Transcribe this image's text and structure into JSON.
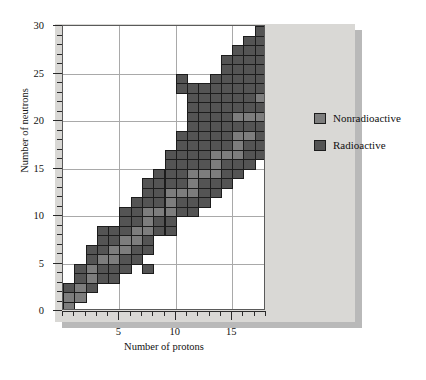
{
  "chart_data": {
    "type": "heatmap",
    "title": "",
    "xlabel": "Number of protons",
    "ylabel": "Number of neutrons",
    "xlim": [
      0,
      18
    ],
    "ylim": [
      0,
      30
    ],
    "xticks": [
      5,
      10,
      15
    ],
    "yticks": [
      0,
      5,
      10,
      15,
      20,
      25,
      30
    ],
    "grid": true,
    "legend_position": "right",
    "series": [
      {
        "name": "Nonradioactive",
        "color": "#7d7d7d"
      },
      {
        "name": "Radioactive",
        "color": "#545454"
      }
    ],
    "x_unit": "protons",
    "y_unit": "neutrons",
    "cells": [
      {
        "x": 1,
        "y": 0,
        "t": "non"
      },
      {
        "x": 1,
        "y": 1,
        "t": "non"
      },
      {
        "x": 1,
        "y": 2,
        "t": "rad"
      },
      {
        "x": 2,
        "y": 1,
        "t": "non"
      },
      {
        "x": 2,
        "y": 2,
        "t": "non"
      },
      {
        "x": 2,
        "y": 3,
        "t": "rad"
      },
      {
        "x": 2,
        "y": 4,
        "t": "rad"
      },
      {
        "x": 3,
        "y": 2,
        "t": "rad"
      },
      {
        "x": 3,
        "y": 3,
        "t": "non"
      },
      {
        "x": 3,
        "y": 4,
        "t": "non"
      },
      {
        "x": 3,
        "y": 5,
        "t": "rad"
      },
      {
        "x": 3,
        "y": 6,
        "t": "rad"
      },
      {
        "x": 4,
        "y": 3,
        "t": "rad"
      },
      {
        "x": 4,
        "y": 4,
        "t": "rad"
      },
      {
        "x": 4,
        "y": 5,
        "t": "non"
      },
      {
        "x": 4,
        "y": 6,
        "t": "rad"
      },
      {
        "x": 4,
        "y": 7,
        "t": "rad"
      },
      {
        "x": 4,
        "y": 8,
        "t": "rad"
      },
      {
        "x": 5,
        "y": 3,
        "t": "rad"
      },
      {
        "x": 5,
        "y": 4,
        "t": "rad"
      },
      {
        "x": 5,
        "y": 5,
        "t": "non"
      },
      {
        "x": 5,
        "y": 6,
        "t": "non"
      },
      {
        "x": 5,
        "y": 7,
        "t": "rad"
      },
      {
        "x": 5,
        "y": 8,
        "t": "rad"
      },
      {
        "x": 6,
        "y": 4,
        "t": "rad"
      },
      {
        "x": 6,
        "y": 5,
        "t": "rad"
      },
      {
        "x": 6,
        "y": 6,
        "t": "non"
      },
      {
        "x": 6,
        "y": 7,
        "t": "non"
      },
      {
        "x": 6,
        "y": 8,
        "t": "rad"
      },
      {
        "x": 6,
        "y": 9,
        "t": "rad"
      },
      {
        "x": 6,
        "y": 10,
        "t": "rad"
      },
      {
        "x": 7,
        "y": 5,
        "t": "rad"
      },
      {
        "x": 7,
        "y": 6,
        "t": "rad"
      },
      {
        "x": 7,
        "y": 7,
        "t": "non"
      },
      {
        "x": 7,
        "y": 8,
        "t": "non"
      },
      {
        "x": 7,
        "y": 9,
        "t": "rad"
      },
      {
        "x": 7,
        "y": 10,
        "t": "rad"
      },
      {
        "x": 7,
        "y": 11,
        "t": "rad"
      },
      {
        "x": 8,
        "y": 6,
        "t": "rad"
      },
      {
        "x": 8,
        "y": 7,
        "t": "rad"
      },
      {
        "x": 8,
        "y": 8,
        "t": "non"
      },
      {
        "x": 8,
        "y": 9,
        "t": "non"
      },
      {
        "x": 8,
        "y": 10,
        "t": "non"
      },
      {
        "x": 8,
        "y": 11,
        "t": "rad"
      },
      {
        "x": 8,
        "y": 12,
        "t": "rad"
      },
      {
        "x": 8,
        "y": 13,
        "t": "rad"
      },
      {
        "x": 8,
        "y": 4,
        "t": "rad"
      },
      {
        "x": 9,
        "y": 8,
        "t": "rad"
      },
      {
        "x": 9,
        "y": 9,
        "t": "rad"
      },
      {
        "x": 9,
        "y": 10,
        "t": "non"
      },
      {
        "x": 9,
        "y": 11,
        "t": "rad"
      },
      {
        "x": 9,
        "y": 12,
        "t": "rad"
      },
      {
        "x": 9,
        "y": 13,
        "t": "rad"
      },
      {
        "x": 9,
        "y": 14,
        "t": "rad"
      },
      {
        "x": 10,
        "y": 8,
        "t": "rad"
      },
      {
        "x": 10,
        "y": 9,
        "t": "rad"
      },
      {
        "x": 10,
        "y": 10,
        "t": "non"
      },
      {
        "x": 10,
        "y": 11,
        "t": "non"
      },
      {
        "x": 10,
        "y": 12,
        "t": "non"
      },
      {
        "x": 10,
        "y": 13,
        "t": "rad"
      },
      {
        "x": 10,
        "y": 14,
        "t": "rad"
      },
      {
        "x": 10,
        "y": 15,
        "t": "rad"
      },
      {
        "x": 10,
        "y": 16,
        "t": "rad"
      },
      {
        "x": 11,
        "y": 10,
        "t": "rad"
      },
      {
        "x": 11,
        "y": 11,
        "t": "rad"
      },
      {
        "x": 11,
        "y": 12,
        "t": "non"
      },
      {
        "x": 11,
        "y": 13,
        "t": "rad"
      },
      {
        "x": 11,
        "y": 14,
        "t": "rad"
      },
      {
        "x": 11,
        "y": 15,
        "t": "rad"
      },
      {
        "x": 11,
        "y": 16,
        "t": "rad"
      },
      {
        "x": 11,
        "y": 17,
        "t": "rad"
      },
      {
        "x": 11,
        "y": 18,
        "t": "rad"
      },
      {
        "x": 11,
        "y": 23,
        "t": "rad"
      },
      {
        "x": 11,
        "y": 24,
        "t": "rad"
      },
      {
        "x": 12,
        "y": 10,
        "t": "rad"
      },
      {
        "x": 12,
        "y": 11,
        "t": "rad"
      },
      {
        "x": 12,
        "y": 12,
        "t": "non"
      },
      {
        "x": 12,
        "y": 13,
        "t": "non"
      },
      {
        "x": 12,
        "y": 14,
        "t": "non"
      },
      {
        "x": 12,
        "y": 15,
        "t": "rad"
      },
      {
        "x": 12,
        "y": 16,
        "t": "rad"
      },
      {
        "x": 12,
        "y": 17,
        "t": "rad"
      },
      {
        "x": 12,
        "y": 18,
        "t": "rad"
      },
      {
        "x": 12,
        "y": 19,
        "t": "rad"
      },
      {
        "x": 12,
        "y": 20,
        "t": "rad"
      },
      {
        "x": 12,
        "y": 21,
        "t": "rad"
      },
      {
        "x": 12,
        "y": 22,
        "t": "rad"
      },
      {
        "x": 12,
        "y": 23,
        "t": "rad"
      },
      {
        "x": 13,
        "y": 11,
        "t": "rad"
      },
      {
        "x": 13,
        "y": 12,
        "t": "rad"
      },
      {
        "x": 13,
        "y": 13,
        "t": "rad"
      },
      {
        "x": 13,
        "y": 14,
        "t": "non"
      },
      {
        "x": 13,
        "y": 15,
        "t": "rad"
      },
      {
        "x": 13,
        "y": 16,
        "t": "rad"
      },
      {
        "x": 13,
        "y": 17,
        "t": "rad"
      },
      {
        "x": 13,
        "y": 18,
        "t": "rad"
      },
      {
        "x": 13,
        "y": 19,
        "t": "rad"
      },
      {
        "x": 13,
        "y": 20,
        "t": "rad"
      },
      {
        "x": 13,
        "y": 21,
        "t": "rad"
      },
      {
        "x": 13,
        "y": 22,
        "t": "rad"
      },
      {
        "x": 13,
        "y": 23,
        "t": "rad"
      },
      {
        "x": 14,
        "y": 12,
        "t": "rad"
      },
      {
        "x": 14,
        "y": 13,
        "t": "rad"
      },
      {
        "x": 14,
        "y": 14,
        "t": "non"
      },
      {
        "x": 14,
        "y": 15,
        "t": "non"
      },
      {
        "x": 14,
        "y": 16,
        "t": "non"
      },
      {
        "x": 14,
        "y": 17,
        "t": "rad"
      },
      {
        "x": 14,
        "y": 18,
        "t": "rad"
      },
      {
        "x": 14,
        "y": 19,
        "t": "rad"
      },
      {
        "x": 14,
        "y": 20,
        "t": "rad"
      },
      {
        "x": 14,
        "y": 21,
        "t": "rad"
      },
      {
        "x": 14,
        "y": 22,
        "t": "rad"
      },
      {
        "x": 14,
        "y": 23,
        "t": "rad"
      },
      {
        "x": 14,
        "y": 24,
        "t": "rad"
      },
      {
        "x": 15,
        "y": 13,
        "t": "rad"
      },
      {
        "x": 15,
        "y": 14,
        "t": "rad"
      },
      {
        "x": 15,
        "y": 15,
        "t": "rad"
      },
      {
        "x": 15,
        "y": 16,
        "t": "non"
      },
      {
        "x": 15,
        "y": 17,
        "t": "rad"
      },
      {
        "x": 15,
        "y": 18,
        "t": "rad"
      },
      {
        "x": 15,
        "y": 19,
        "t": "rad"
      },
      {
        "x": 15,
        "y": 20,
        "t": "rad"
      },
      {
        "x": 15,
        "y": 21,
        "t": "rad"
      },
      {
        "x": 15,
        "y": 22,
        "t": "rad"
      },
      {
        "x": 15,
        "y": 23,
        "t": "rad"
      },
      {
        "x": 15,
        "y": 24,
        "t": "rad"
      },
      {
        "x": 15,
        "y": 25,
        "t": "rad"
      },
      {
        "x": 15,
        "y": 26,
        "t": "rad"
      },
      {
        "x": 16,
        "y": 14,
        "t": "rad"
      },
      {
        "x": 16,
        "y": 15,
        "t": "rad"
      },
      {
        "x": 16,
        "y": 16,
        "t": "non"
      },
      {
        "x": 16,
        "y": 17,
        "t": "non"
      },
      {
        "x": 16,
        "y": 18,
        "t": "non"
      },
      {
        "x": 16,
        "y": 19,
        "t": "rad"
      },
      {
        "x": 16,
        "y": 20,
        "t": "non"
      },
      {
        "x": 16,
        "y": 21,
        "t": "rad"
      },
      {
        "x": 16,
        "y": 22,
        "t": "rad"
      },
      {
        "x": 16,
        "y": 23,
        "t": "rad"
      },
      {
        "x": 16,
        "y": 24,
        "t": "rad"
      },
      {
        "x": 16,
        "y": 25,
        "t": "rad"
      },
      {
        "x": 16,
        "y": 26,
        "t": "rad"
      },
      {
        "x": 16,
        "y": 27,
        "t": "rad"
      },
      {
        "x": 17,
        "y": 15,
        "t": "rad"
      },
      {
        "x": 17,
        "y": 16,
        "t": "rad"
      },
      {
        "x": 17,
        "y": 17,
        "t": "rad"
      },
      {
        "x": 17,
        "y": 18,
        "t": "non"
      },
      {
        "x": 17,
        "y": 19,
        "t": "rad"
      },
      {
        "x": 17,
        "y": 20,
        "t": "non"
      },
      {
        "x": 17,
        "y": 21,
        "t": "rad"
      },
      {
        "x": 17,
        "y": 22,
        "t": "rad"
      },
      {
        "x": 17,
        "y": 23,
        "t": "rad"
      },
      {
        "x": 17,
        "y": 24,
        "t": "rad"
      },
      {
        "x": 17,
        "y": 25,
        "t": "rad"
      },
      {
        "x": 17,
        "y": 26,
        "t": "rad"
      },
      {
        "x": 17,
        "y": 27,
        "t": "rad"
      },
      {
        "x": 17,
        "y": 28,
        "t": "rad"
      },
      {
        "x": 18,
        "y": 16,
        "t": "rad"
      },
      {
        "x": 18,
        "y": 17,
        "t": "rad"
      },
      {
        "x": 18,
        "y": 18,
        "t": "rad"
      },
      {
        "x": 18,
        "y": 19,
        "t": "rad"
      },
      {
        "x": 18,
        "y": 20,
        "t": "non"
      },
      {
        "x": 18,
        "y": 21,
        "t": "rad"
      },
      {
        "x": 18,
        "y": 22,
        "t": "non"
      },
      {
        "x": 18,
        "y": 23,
        "t": "rad"
      },
      {
        "x": 18,
        "y": 24,
        "t": "rad"
      },
      {
        "x": 18,
        "y": 25,
        "t": "rad"
      },
      {
        "x": 18,
        "y": 26,
        "t": "rad"
      },
      {
        "x": 18,
        "y": 27,
        "t": "rad"
      },
      {
        "x": 18,
        "y": 28,
        "t": "rad"
      },
      {
        "x": 18,
        "y": 29,
        "t": "rad"
      }
    ]
  },
  "legend": {
    "items": [
      {
        "label": "Nonradioactive",
        "swatch": "non"
      },
      {
        "label": "Radioactive",
        "swatch": "rad"
      }
    ]
  }
}
